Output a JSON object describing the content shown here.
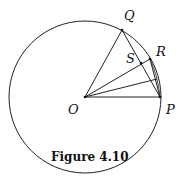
{
  "figure": {
    "caption": "Figure 4.10",
    "labels": {
      "O": "O",
      "P": "P",
      "Q": "Q",
      "R": "R",
      "S": "S"
    }
  },
  "geometry": {
    "circle": {
      "cx": 85,
      "cy": 97,
      "r": 76
    },
    "points": {
      "O": [
        85,
        97
      ],
      "P": [
        160,
        97
      ],
      "Q": [
        122,
        30
      ],
      "R": [
        150,
        59
      ],
      "S": [
        141,
        63
      ],
      "T": [
        157,
        79
      ]
    },
    "segments": [
      [
        "O",
        "Q"
      ],
      [
        "O",
        "R"
      ],
      [
        "O",
        "T"
      ],
      [
        "O",
        "P"
      ],
      [
        "Q",
        "P"
      ],
      [
        "R",
        "P"
      ]
    ],
    "colors": {
      "stroke": "#222222",
      "text": "#111111"
    }
  }
}
